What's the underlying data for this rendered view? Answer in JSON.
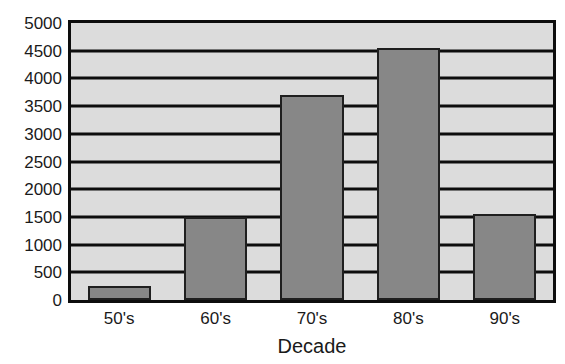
{
  "chart_data": {
    "type": "bar",
    "title": "",
    "subtitle": "",
    "xlabel": "Decade",
    "ylabel": "",
    "categories": [
      "50's",
      "60's",
      "70's",
      "80's",
      "90's"
    ],
    "values": [
      250,
      1500,
      3700,
      4550,
      1550
    ],
    "ylim": [
      0,
      5000
    ],
    "ytick_step": 500,
    "yticks": [
      5000,
      4500,
      4000,
      3500,
      3000,
      2500,
      2000,
      1500,
      1000,
      500,
      0
    ],
    "ytick_labels": [
      "5000",
      "4500",
      "4000",
      "3500",
      "3000",
      "2500",
      "2000",
      "1500",
      "1000",
      "500",
      "0"
    ],
    "grid": true,
    "grid_orientation": "horizontal",
    "legend": false,
    "legend_position": "none",
    "annotations": [],
    "series": [
      {
        "name": "",
        "values": [
          250,
          1500,
          3700,
          4550,
          1550
        ]
      }
    ],
    "colors": {
      "bar_fill": "#878787",
      "bar_border": "#1f1f1f",
      "plot_background": "#dcdcdc",
      "frame": "#0d0d0d",
      "gridline": "#0d0d0d",
      "text": "#1a1a1a",
      "figure_background": "#ffffff"
    }
  }
}
